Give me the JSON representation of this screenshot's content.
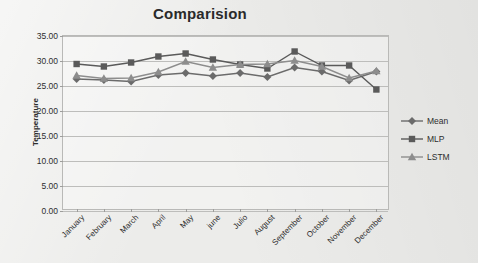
{
  "chart_data": {
    "type": "line",
    "title": "Comparision",
    "xlabel": "",
    "ylabel": "Temperature",
    "ylim": [
      0.0,
      35.0
    ],
    "ytick_step": 5.0,
    "ytick_labels": [
      "0.00",
      "5.00",
      "10.00",
      "15.00",
      "20.00",
      "25.00",
      "30.00",
      "35.00"
    ],
    "ytick_values": [
      0,
      5,
      10,
      15,
      20,
      25,
      30,
      35
    ],
    "grid": true,
    "legend_position": "right",
    "categories": [
      "January",
      "February",
      "March",
      "April",
      "May",
      "june",
      "Julio",
      "August",
      "September",
      "October",
      "November",
      "December"
    ],
    "series": [
      {
        "name": "Mean",
        "marker": "diamond",
        "color": "#6b6b6b",
        "values": [
          26.4,
          26.2,
          25.9,
          27.2,
          27.6,
          27.0,
          27.6,
          26.8,
          28.7,
          27.9,
          26.1,
          27.9
        ]
      },
      {
        "name": "MLP",
        "marker": "square",
        "color": "#5a5a5a",
        "values": [
          29.4,
          28.9,
          29.7,
          30.9,
          31.5,
          30.3,
          29.3,
          28.5,
          31.9,
          29.1,
          29.1,
          24.3
        ]
      },
      {
        "name": "LSTM",
        "marker": "triangle",
        "color": "#8d8d8d",
        "values": [
          27.1,
          26.5,
          26.6,
          27.8,
          29.9,
          28.7,
          29.3,
          29.4,
          30.1,
          28.9,
          26.6,
          28.0
        ]
      }
    ]
  },
  "chart": {
    "title": "Comparision",
    "y_axis_title": "Temperature"
  },
  "legend": {
    "items": [
      {
        "label": "Mean"
      },
      {
        "label": "MLP"
      },
      {
        "label": "LSTM"
      }
    ]
  }
}
